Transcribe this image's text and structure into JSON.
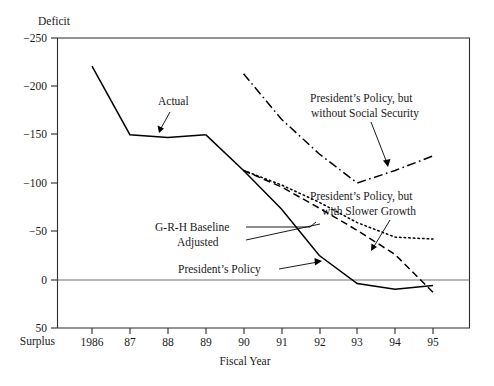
{
  "chart_data": {
    "type": "line",
    "title": "",
    "xlabel": "Fiscal Year",
    "ylabel": "Deficit",
    "ylabel_bottom": "Surplus",
    "ylim": [
      -250,
      50
    ],
    "yticks": [
      -250,
      -200,
      -150,
      -100,
      -50,
      0,
      50
    ],
    "ytick_labels": [
      "−250",
      "−200",
      "−150",
      "−100",
      "−50",
      "0",
      "50"
    ],
    "xlim": [
      1986,
      1995
    ],
    "xticks": [
      1986,
      1987,
      1988,
      1989,
      1990,
      1991,
      1992,
      1993,
      1994,
      1995
    ],
    "xtick_labels": [
      "1986",
      "87",
      "88",
      "89",
      "90",
      "91",
      "92",
      "93",
      "94",
      "95"
    ],
    "grid": false,
    "legend_position": "inline-annotations",
    "zero_reference_line": 0,
    "series": [
      {
        "name": "Actual",
        "style": "solid",
        "x": [
          1986,
          1987,
          1988,
          1989
        ],
        "values": [
          -221,
          -150,
          -147,
          -150
        ]
      },
      {
        "name": "President's Policy",
        "style": "solid",
        "x": [
          1989,
          1990,
          1991,
          1992,
          1993,
          1994,
          1995
        ],
        "values": [
          -150,
          -113,
          -73,
          -25,
          4,
          10,
          6
        ]
      },
      {
        "name": "G-R-H Baseline Adjusted",
        "style": "dashed",
        "x": [
          1990,
          1991,
          1992,
          1993,
          1994,
          1995
        ],
        "values": [
          -113,
          -96,
          -74,
          -51,
          -26,
          13
        ]
      },
      {
        "name": "President's Policy, but with Slower Growth",
        "style": "dotted",
        "x": [
          1990,
          1991,
          1992,
          1993,
          1994,
          1995
        ],
        "values": [
          -113,
          -98,
          -80,
          -59,
          -44,
          -42
        ]
      },
      {
        "name": "President's Policy, but without Social Security",
        "style": "dash-dot",
        "x": [
          1990,
          1991,
          1992,
          1993,
          1994,
          1995
        ],
        "values": [
          -213,
          -166,
          -130,
          -100,
          -113,
          -128
        ]
      }
    ],
    "annotations": [
      {
        "id": "actual",
        "text": "Actual",
        "lines": [
          "Actual"
        ]
      },
      {
        "id": "grh",
        "text": "G-R-H Baseline Adjusted",
        "lines": [
          "G-R-H Baseline",
          "Adjusted"
        ]
      },
      {
        "id": "presidents-policy",
        "text": "President's Policy",
        "lines": [
          "President’s Policy"
        ]
      },
      {
        "id": "without-social-security",
        "text": "President's Policy, but without Social Security",
        "lines": [
          "President’s Policy, but",
          "without Social Security"
        ]
      },
      {
        "id": "slower-growth",
        "text": "President's Policy, but with Slower Growth",
        "lines": [
          "President’s Policy, but",
          "with Slower Growth"
        ]
      }
    ]
  },
  "axes": {
    "y_top_label": "Deficit",
    "y_bottom_label": "Surplus",
    "x_axis_title": "Fiscal Year"
  },
  "colors": {
    "ink": "#1a1a1a",
    "axis": "#2b2b2b",
    "zero_line": "#6e6e6e",
    "background": "#ffffff"
  }
}
